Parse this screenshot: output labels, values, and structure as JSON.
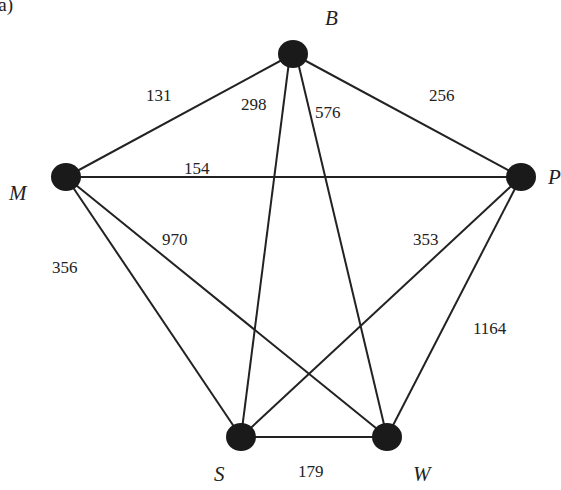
{
  "figure_label": "(a)",
  "nodes": [
    {
      "id": "B",
      "label": "B",
      "x": 293,
      "y": 54
    },
    {
      "id": "M",
      "label": "M",
      "x": 66,
      "y": 177
    },
    {
      "id": "P",
      "label": "P",
      "x": 521,
      "y": 177
    },
    {
      "id": "S",
      "label": "S",
      "x": 241,
      "y": 437
    },
    {
      "id": "W",
      "label": "W",
      "x": 387,
      "y": 437
    }
  ],
  "edges": [
    {
      "from": "M",
      "to": "B",
      "weight": "131"
    },
    {
      "from": "S",
      "to": "B",
      "weight": "298"
    },
    {
      "from": "W",
      "to": "B",
      "weight": "576"
    },
    {
      "from": "B",
      "to": "P",
      "weight": "256"
    },
    {
      "from": "M",
      "to": "P",
      "weight": "154"
    },
    {
      "from": "M",
      "to": "W",
      "weight": "970"
    },
    {
      "from": "M",
      "to": "S",
      "weight": "356"
    },
    {
      "from": "S",
      "to": "P",
      "weight": "353"
    },
    {
      "from": "W",
      "to": "P",
      "weight": "1164"
    },
    {
      "from": "S",
      "to": "W",
      "weight": "179"
    }
  ]
}
